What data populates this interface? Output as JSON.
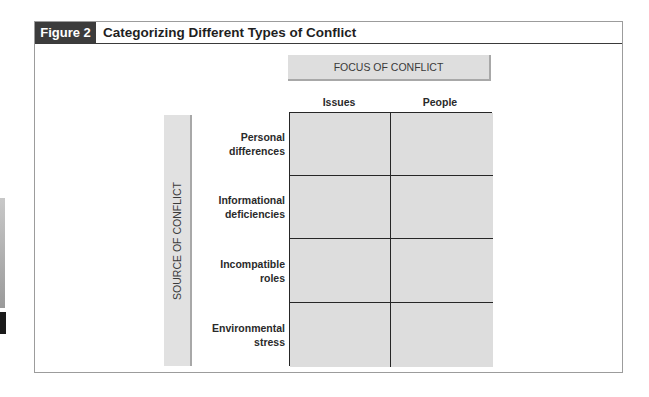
{
  "figure": {
    "label": "Figure 2",
    "title": "Categorizing Different Types of Conflict"
  },
  "axes": {
    "focus_title": "FOCUS OF CONFLICT",
    "source_title": "SOURCE OF CONFLICT"
  },
  "columns": [
    {
      "label": "Issues"
    },
    {
      "label": "People"
    }
  ],
  "rows": [
    {
      "line1": "Personal",
      "line2": "differences"
    },
    {
      "line1": "Informational",
      "line2": "deficiencies"
    },
    {
      "line1": "Incompatible",
      "line2": "roles"
    },
    {
      "line1": "Environmental",
      "line2": "stress"
    }
  ],
  "cells": [
    [
      "",
      ""
    ],
    [
      "",
      ""
    ],
    [
      "",
      ""
    ],
    [
      "",
      ""
    ]
  ],
  "colors": {
    "label_bg": "#3c3c3c",
    "cell_fill": "#dddddd",
    "axis_box_fill": "#dedede",
    "grid_line": "#262626",
    "frame_border": "#9c9c9c"
  }
}
